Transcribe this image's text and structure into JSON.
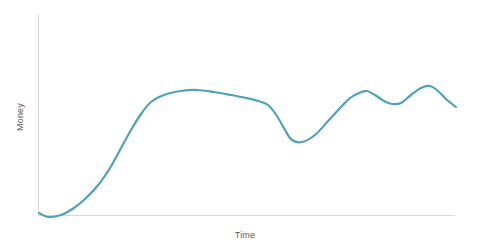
{
  "chart_data": {
    "type": "line",
    "title": "",
    "subtitle": "",
    "xlabel": "Time",
    "ylabel": "Money",
    "grid": false,
    "legend": false,
    "legend_position": "none",
    "xticks": [],
    "yticks": [],
    "xtick_labels": [],
    "ytick_labels": [],
    "xlim": [
      0,
      100
    ],
    "ylim": [
      0,
      100
    ],
    "annotations": [],
    "series": [
      {
        "name": "Money",
        "color": "#4fa3b3",
        "line_width": 2.2,
        "markers": false,
        "smooth": true,
        "x": [
          0,
          2.2,
          5.3,
          8.4,
          11.2,
          14.4,
          17.0,
          19.4,
          22.0,
          24.5,
          26.9,
          30.0,
          34.0,
          38.0,
          42.0,
          46.0,
          49.6,
          52.4,
          54.8,
          57.0,
          58.8,
          60.5,
          63.0,
          66.0,
          69.5,
          72.6,
          74.5,
          76.6,
          78.5,
          80.5,
          82.5,
          84.5,
          86.6,
          89.0,
          91.5,
          93.6,
          95.5,
          97.5,
          100
        ],
        "y": [
          1.0,
          0.0,
          1.5,
          5.0,
          10.0,
          17.0,
          25.0,
          34.0,
          44.0,
          52.0,
          58.0,
          62.5,
          64.5,
          64.8,
          64.0,
          62.5,
          60.8,
          59.5,
          57.5,
          52.0,
          45.0,
          40.0,
          39.0,
          42.5,
          50.0,
          57.0,
          61.0,
          63.5,
          64.0,
          62.0,
          59.5,
          58.0,
          58.5,
          62.0,
          65.5,
          66.2,
          64.0,
          60.0,
          56.0
        ],
        "x_pixels": [
          39,
          48,
          61,
          74,
          86,
          99,
          110,
          120,
          131,
          141,
          151,
          164,
          181,
          197,
          214,
          231,
          246,
          258,
          268,
          277,
          285,
          292,
          302,
          315,
          329,
          342,
          350,
          359,
          367,
          375,
          384,
          392,
          401,
          411,
          421,
          430,
          438,
          446,
          456
        ],
        "y_pixels": [
          213,
          217,
          215,
          208,
          198,
          184,
          168,
          150,
          130,
          114,
          102,
          95,
          91,
          90,
          92,
          95,
          98,
          101,
          105,
          116,
          130,
          140,
          142,
          135,
          120,
          106,
          98,
          93,
          91,
          95,
          101,
          104,
          103,
          95,
          88,
          86,
          91,
          99,
          107
        ]
      }
    ]
  },
  "axes": {
    "y_axis_name": "y-axis-line",
    "x_axis_name": "x-axis-line",
    "color": "#d8d8d8"
  }
}
